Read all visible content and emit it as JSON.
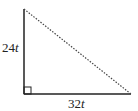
{
  "diagram": {
    "type": "right-triangle",
    "vertical_leg": {
      "coefficient": "24",
      "variable": "t"
    },
    "horizontal_leg": {
      "coefficient": "32",
      "variable": "t"
    },
    "hypotenuse_style": "dotted",
    "right_angle_marker": true,
    "colors": {
      "stroke": "#222222",
      "hypotenuse": "#444444",
      "background": "#ffffff"
    }
  }
}
